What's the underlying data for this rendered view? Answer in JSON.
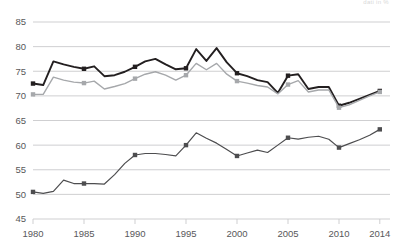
{
  "corner_note": "dati in %",
  "chart_data": {
    "type": "line",
    "title": "",
    "subtitle": "",
    "xlabel": "",
    "ylabel": "",
    "xlim": [
      1980,
      2015
    ],
    "ylim": [
      45,
      85
    ],
    "yticks": [
      45,
      50,
      55,
      60,
      65,
      70,
      75,
      80,
      85
    ],
    "xticks": [
      1980,
      1985,
      1990,
      1995,
      2000,
      2005,
      2010,
      2014
    ],
    "grid": true,
    "legend": "none",
    "marker_years": [
      1980,
      1985,
      1990,
      1995,
      2000,
      2005,
      2010,
      2014
    ],
    "x": [
      1980,
      1981,
      1982,
      1983,
      1984,
      1985,
      1986,
      1987,
      1988,
      1989,
      1990,
      1991,
      1992,
      1993,
      1994,
      1995,
      1996,
      1997,
      1998,
      1999,
      2000,
      2001,
      2002,
      2003,
      2004,
      2005,
      2006,
      2007,
      2008,
      2009,
      2010,
      2011,
      2012,
      2013,
      2014
    ],
    "series": [
      {
        "name": "upper-dark-line",
        "color": "#231f20",
        "values": [
          72.5,
          72.2,
          77.0,
          76.4,
          75.9,
          75.5,
          76.0,
          74.0,
          74.2,
          74.9,
          75.9,
          77.0,
          77.5,
          76.4,
          75.4,
          75.6,
          79.5,
          77.1,
          79.7,
          76.8,
          74.6,
          74.0,
          73.2,
          72.8,
          70.6,
          74.1,
          74.4,
          71.4,
          71.8,
          71.8,
          68.0,
          68.6,
          69.4,
          70.2,
          71.0
        ]
      },
      {
        "name": "upper-grey-line",
        "color": "#a6a8ab",
        "values": [
          70.3,
          70.3,
          73.8,
          73.2,
          72.8,
          72.6,
          73.0,
          71.4,
          71.9,
          72.5,
          73.5,
          74.4,
          74.9,
          74.2,
          73.2,
          74.2,
          76.6,
          75.3,
          76.6,
          74.4,
          73.0,
          72.6,
          72.1,
          71.8,
          70.4,
          72.3,
          73.1,
          70.8,
          71.2,
          71.2,
          67.6,
          68.2,
          69.1,
          70.0,
          70.8
        ]
      },
      {
        "name": "lower-line",
        "color": "#4d4d4f",
        "values": [
          50.5,
          50.2,
          50.6,
          52.9,
          52.2,
          52.2,
          52.2,
          52.1,
          54.0,
          56.3,
          58.0,
          58.3,
          58.3,
          58.1,
          57.8,
          60.0,
          62.5,
          61.4,
          60.4,
          59.1,
          57.8,
          58.4,
          59.0,
          58.5,
          60.0,
          61.5,
          61.2,
          61.6,
          61.8,
          61.2,
          59.5,
          60.3,
          61.1,
          62.0,
          63.2
        ]
      }
    ]
  }
}
